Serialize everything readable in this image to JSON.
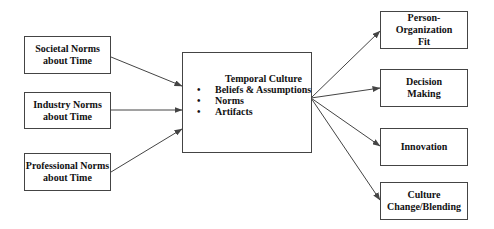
{
  "diagram": {
    "inputs": [
      {
        "line1": "Societal Norms",
        "line2": "about Time"
      },
      {
        "line1": "Industry Norms",
        "line2": "about Time"
      },
      {
        "line1": "Professional Norms",
        "line2": "about Time"
      }
    ],
    "center": {
      "title": "Temporal Culture",
      "bullet_glyph": "•",
      "bullets": [
        "Beliefs & Assumptions",
        "Norms",
        "Artifacts"
      ]
    },
    "outputs": [
      {
        "line1": "Person-Organization",
        "line2": "Fit"
      },
      {
        "line1": "Decision",
        "line2": "Making"
      },
      {
        "line1": "Innovation",
        "line2": ""
      },
      {
        "line1": "Culture",
        "line2": "Change/Blending"
      }
    ],
    "edges": [
      {
        "from": "Societal Norms about Time",
        "to": "Temporal Culture"
      },
      {
        "from": "Industry Norms about Time",
        "to": "Temporal Culture"
      },
      {
        "from": "Professional Norms about Time",
        "to": "Temporal Culture"
      },
      {
        "from": "Temporal Culture",
        "to": "Person-Organization Fit"
      },
      {
        "from": "Temporal Culture",
        "to": "Decision Making"
      },
      {
        "from": "Temporal Culture",
        "to": "Innovation"
      },
      {
        "from": "Temporal Culture",
        "to": "Culture Change/Blending"
      }
    ],
    "colors": {
      "line": "#444444",
      "background": "#ffffff",
      "text": "#111111"
    }
  }
}
